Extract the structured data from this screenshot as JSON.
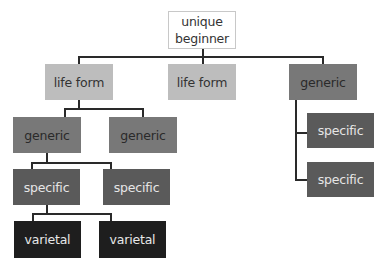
{
  "diagram": {
    "type": "taxonomy-tree",
    "nodes": {
      "root": {
        "label": "unique\nbeginner",
        "line1": "unique",
        "line2": "beginner"
      },
      "lifeform_left": {
        "label": "life form"
      },
      "lifeform_middle": {
        "label": "life form"
      },
      "generic_right": {
        "label": "generic"
      },
      "generic_left_a": {
        "label": "generic"
      },
      "generic_left_b": {
        "label": "generic"
      },
      "specific_left_a": {
        "label": "specific"
      },
      "specific_left_b": {
        "label": "specific"
      },
      "varietal_a": {
        "label": "varietal"
      },
      "varietal_b": {
        "label": "varietal"
      },
      "specific_right_a": {
        "label": "specific"
      },
      "specific_right_b": {
        "label": "specific"
      }
    },
    "edges": [
      [
        "root",
        "lifeform_left"
      ],
      [
        "root",
        "lifeform_middle"
      ],
      [
        "root",
        "generic_right"
      ],
      [
        "lifeform_left",
        "generic_left_a"
      ],
      [
        "lifeform_left",
        "generic_left_b"
      ],
      [
        "generic_left_a",
        "specific_left_a"
      ],
      [
        "generic_left_a",
        "specific_left_b"
      ],
      [
        "specific_left_a",
        "varietal_a"
      ],
      [
        "specific_left_a",
        "varietal_b"
      ],
      [
        "generic_right",
        "specific_right_a"
      ],
      [
        "generic_right",
        "specific_right_b"
      ]
    ],
    "colors": {
      "root": "#ffffff",
      "life_form": "#bdbdbd",
      "generic": "#787878",
      "specific": "#5a5a5a",
      "varietal": "#1e1e1e",
      "connector": "#2a2a2a"
    }
  }
}
